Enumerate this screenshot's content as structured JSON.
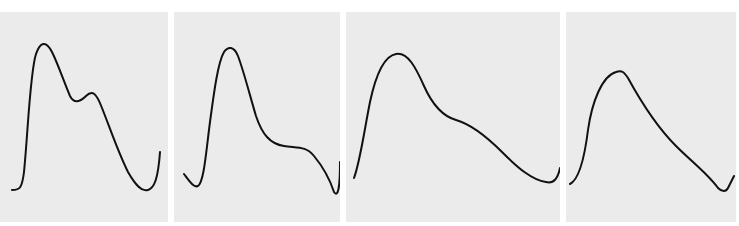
{
  "figure": {
    "background": "#ffffff",
    "panel_color": "#ebebeb",
    "stroke_color": "#111111",
    "panels": [
      {
        "id": "panel-1",
        "description": "Waveform with tall early peak, dicrotic notch, and second smaller peak"
      },
      {
        "id": "panel-2",
        "description": "Waveform with sharp early peak and shallow late shoulder"
      },
      {
        "id": "panel-3",
        "description": "Waveform with rounded peak and broad late shoulder"
      },
      {
        "id": "panel-4",
        "description": "Waveform with single peak and linear decay"
      }
    ]
  }
}
